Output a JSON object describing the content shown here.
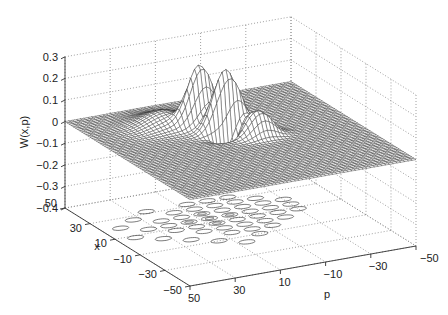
{
  "chart_data": {
    "type": "surface3d",
    "title": "",
    "xlabel": "x",
    "ylabel": "p",
    "zlabel": "W(x,p)",
    "x_ticks": [
      50,
      30,
      10,
      -10,
      -30,
      -50
    ],
    "p_ticks": [
      50,
      30,
      10,
      -10,
      -30,
      -50
    ],
    "z_ticks": [
      0.3,
      0.2,
      0.1,
      0,
      -0.1,
      -0.2,
      -0.3,
      -0.4
    ],
    "x_tick_labels": [
      "50",
      "30",
      "10",
      "−10",
      "−30",
      "−50"
    ],
    "p_tick_labels": [
      "50",
      "30",
      "10",
      "−10",
      "−30",
      "−50"
    ],
    "z_tick_labels": [
      "0.3",
      "0.2",
      "0.1",
      "0",
      "−0.1",
      "−0.2",
      "−0.3",
      "−0.4"
    ],
    "xlim": [
      -50,
      50
    ],
    "plim": [
      -50,
      50
    ],
    "zlim": [
      -0.4,
      0.3
    ],
    "grid": true,
    "projected_contour_on_floor": true,
    "surface_description": "Wigner function: flat ~0 plane with oscillating interference peaks near x=10..40, p=-10..20; broad hump near x=25,p=15; max ~0.2, negative dip ~-0.15",
    "peaks": [
      {
        "x": 30,
        "p": 18,
        "z": 0.06,
        "width": 7,
        "note": "broad hump"
      },
      {
        "x": 22,
        "p": 8,
        "z": 0.17,
        "width": 2.6
      },
      {
        "x": 20,
        "p": 4,
        "z": 0.16,
        "width": 2.6
      },
      {
        "x": 12,
        "p": 2,
        "z": 0.21,
        "width": 2.6
      },
      {
        "x": 10,
        "p": -3,
        "z": 0.15,
        "width": 2.6
      },
      {
        "x": 4,
        "p": -6,
        "z": 0.08,
        "width": 2.6
      },
      {
        "x": 0,
        "p": -10,
        "z": 0.09,
        "width": 2.6
      },
      {
        "x": 6,
        "p": 2,
        "z": -0.13,
        "width": 2.2,
        "note": "negative dip"
      }
    ]
  }
}
